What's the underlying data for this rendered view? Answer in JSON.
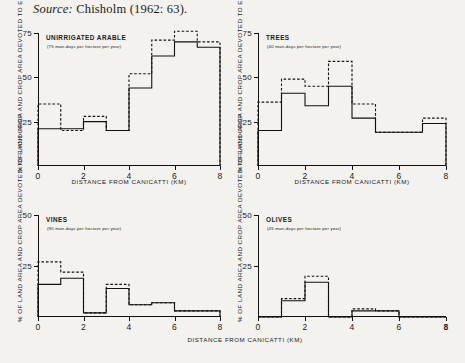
{
  "source": {
    "prefix": "Source:",
    "citation": "Chisholm (1962: 63)."
  },
  "axis_titles": {
    "x": "DISTANCE FROM CANICATTI  (KM)",
    "y": "% OF LAND AREA AND CROP AREA DEVOTED TO EACH CROP"
  },
  "legend_note": {
    "solid": "% of crop area",
    "dashed": "% of land area"
  },
  "chart_data": [
    {
      "type": "bar",
      "id": "unirrigated-arable",
      "title": "UNIRRIGATED ARABLE",
      "subtitle": "(75 man-days per hectare per year)",
      "xlabel": "DISTANCE FROM CANICATTI  (KM)",
      "ylabel": "% OF LAND AREA AND CROP AREA DEVOTED TO EACH CROP",
      "categories": [
        "0-1",
        "1-2",
        "2-3",
        "3-4",
        "4-5",
        "5-6",
        "6-7",
        "7-8"
      ],
      "x": [
        0,
        1,
        2,
        3,
        4,
        5,
        6,
        7,
        8
      ],
      "xlim": [
        0,
        8
      ],
      "ylim": [
        0,
        75
      ],
      "yticks": [
        25,
        50,
        75
      ],
      "xticks": [
        0,
        2,
        4,
        6,
        8
      ],
      "grid": false,
      "series": [
        {
          "name": "% of crop area",
          "style": "solid",
          "values": [
            21,
            21,
            25,
            20,
            44,
            62,
            70,
            67
          ]
        },
        {
          "name": "% of land area",
          "style": "dashed",
          "values": [
            35,
            20,
            28,
            20,
            52,
            71,
            76,
            70
          ]
        }
      ]
    },
    {
      "type": "bar",
      "id": "trees",
      "title": "TREES",
      "subtitle": "(40 man-days per hectare per year)",
      "xlabel": "DISTANCE FROM CANICATTI  (KM)",
      "ylabel": "% OF LAND AREA AND CROP AREA DEVOTED TO EACH CROP",
      "categories": [
        "0-1",
        "1-2",
        "2-3",
        "3-4",
        "4-5",
        "5-6",
        "6-7",
        "7-8"
      ],
      "x": [
        0,
        1,
        2,
        3,
        4,
        5,
        6,
        7,
        8
      ],
      "xlim": [
        0,
        8
      ],
      "ylim": [
        0,
        75
      ],
      "yticks": [
        25,
        50,
        75
      ],
      "xticks": [
        0,
        2,
        4,
        6,
        8
      ],
      "grid": false,
      "series": [
        {
          "name": "% of crop area",
          "style": "solid",
          "values": [
            20,
            41,
            34,
            45,
            27,
            19,
            19,
            24
          ]
        },
        {
          "name": "% of land area",
          "style": "dashed",
          "values": [
            36,
            49,
            45,
            59,
            35,
            19,
            19,
            27
          ]
        }
      ]
    },
    {
      "type": "bar",
      "id": "vines",
      "title": "VINES",
      "subtitle": "(90 man-days per hectare per year)",
      "xlabel": "DISTANCE FROM CANICATTI  (KM)",
      "ylabel": "% OF LAND AREA AND CROP AREA DEVOTED TO EACH CROP",
      "categories": [
        "0-1",
        "1-2",
        "2-3",
        "3-4",
        "4-5",
        "5-6",
        "6-7",
        "7-8"
      ],
      "x": [
        0,
        1,
        2,
        3,
        4,
        5,
        6,
        7,
        8
      ],
      "xlim": [
        0,
        8
      ],
      "ylim": [
        0,
        50
      ],
      "yticks": [
        25,
        50
      ],
      "xticks": [
        0,
        2,
        4,
        6,
        8
      ],
      "grid": false,
      "series": [
        {
          "name": "% of crop area",
          "style": "solid",
          "values": [
            16,
            19,
            2,
            14,
            6,
            7,
            3,
            3
          ]
        },
        {
          "name": "% of land area",
          "style": "dashed",
          "values": [
            27,
            22,
            2,
            16,
            6,
            7,
            3,
            3
          ]
        }
      ]
    },
    {
      "type": "bar",
      "id": "olives",
      "title": "OLIVES",
      "subtitle": "(45 man-days per hectare per year)",
      "xlabel": "DISTANCE FROM CANICATTI  (KM)",
      "ylabel": "% OF LAND AREA AND CROP AREA DEVOTED TO EACH CROP",
      "categories": [
        "0-1",
        "1-2",
        "2-3",
        "3-4",
        "4-5",
        "5-6",
        "6-7",
        "7-8"
      ],
      "x": [
        0,
        1,
        2,
        3,
        4,
        5,
        6,
        7,
        8
      ],
      "xlim": [
        0,
        8
      ],
      "ylim": [
        0,
        50
      ],
      "yticks": [
        25,
        50
      ],
      "xticks": [
        0,
        2,
        4,
        6,
        8
      ],
      "grid": false,
      "series": [
        {
          "name": "% of crop area",
          "style": "solid",
          "values": [
            0,
            8,
            17,
            0,
            3,
            3,
            0,
            0
          ]
        },
        {
          "name": "% of land area",
          "style": "dashed",
          "values": [
            0,
            9,
            20,
            0,
            4,
            3,
            0,
            0
          ]
        }
      ]
    }
  ]
}
